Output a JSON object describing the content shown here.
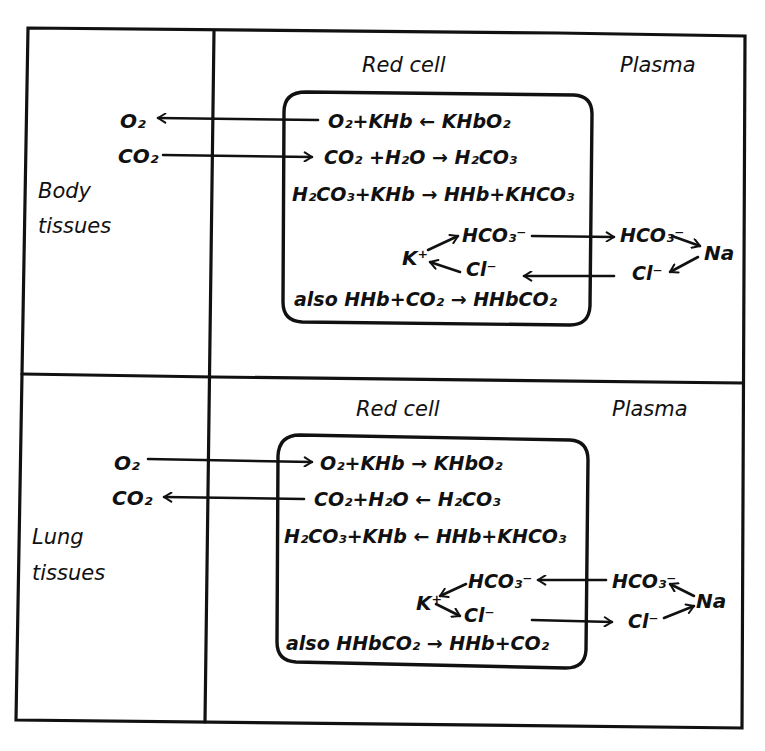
{
  "diagram": {
    "type": "hand-drawn schematic",
    "colors": {
      "ink": "#111111",
      "paper": "#ffffff"
    },
    "sections": [
      {
        "id": "body",
        "side_label_line1": "Body",
        "side_label_line2": "tissues",
        "col_red_cell": "Red cell",
        "col_plasma": "Plasma",
        "gas_o2": "O₂",
        "gas_co2": "CO₂",
        "o2_arrow": "out",
        "co2_arrow": "in",
        "eq1": "O₂+KHb ← KHbO₂",
        "eq2": "CO₂ +H₂O → H₂CO₃",
        "eq3": "H₂CO₃+KHb → HHb+KHCO₃",
        "ion_k": "K⁺",
        "ion_hco3_cell": "HCO₃⁻",
        "ion_cl_cell": "Cl⁻",
        "ion_hco3_plasma": "HCO₃⁻",
        "ion_cl_plasma": "Cl⁻",
        "ion_na": "Na",
        "also": "also HHb+CO₂ → HHbCO₂"
      },
      {
        "id": "lung",
        "side_label_line1": "Lung",
        "side_label_line2": "tissues",
        "col_red_cell": "Red cell",
        "col_plasma": "Plasma",
        "gas_o2": "O₂",
        "gas_co2": "CO₂",
        "o2_arrow": "in",
        "co2_arrow": "out",
        "eq1": "O₂+KHb → KHbO₂",
        "eq2": "CO₂+H₂O ← H₂CO₃",
        "eq3": "H₂CO₃+KHb ← HHb+KHCO₃",
        "ion_k": "K⁺",
        "ion_hco3_cell": "HCO₃⁻",
        "ion_cl_cell": "Cl⁻",
        "ion_hco3_plasma": "HCO₃⁻",
        "ion_cl_plasma": "Cl⁻",
        "ion_na": "Na",
        "also": "also HHbCO₂ → HHb+CO₂"
      }
    ]
  }
}
